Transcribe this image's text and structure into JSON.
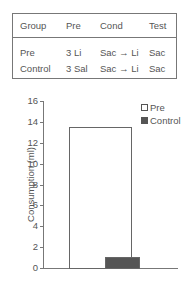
{
  "table": {
    "headers": [
      "Group",
      "Pre",
      "Cond",
      "Test"
    ],
    "rows": [
      [
        "Pre",
        "3 Li",
        "Sac → Li",
        "Sac"
      ],
      [
        "Control",
        "3 Sal",
        "Sac → Li",
        "Sac"
      ]
    ]
  },
  "chart_data": {
    "type": "bar",
    "title": "",
    "xlabel": "",
    "ylabel": "Consumption (ml)",
    "categories": [
      "Pre",
      "Control"
    ],
    "values": [
      13.5,
      1.1
    ],
    "ylim": [
      0,
      16
    ],
    "yticks": [
      "0",
      "2",
      "4",
      "6",
      "8",
      "10",
      "12",
      "14",
      "16"
    ],
    "grid": false,
    "legend": {
      "position": "upper right",
      "entries": [
        "Pre",
        "Control"
      ]
    },
    "colors": {
      "Pre": "#ffffff",
      "Control": "#555555"
    }
  }
}
